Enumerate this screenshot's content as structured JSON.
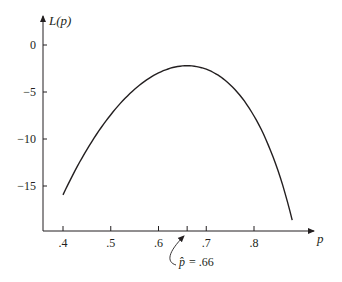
{
  "chart_data": {
    "type": "line",
    "title": "",
    "xlabel": "p",
    "ylabel": "L(p)",
    "xlim": [
      0.355,
      0.92
    ],
    "ylim": [
      -19.5,
      3.2
    ],
    "grid": false,
    "legend": null,
    "x_ticks": [
      0.4,
      0.5,
      0.6,
      0.7,
      0.8
    ],
    "x_tick_labels": [
      ".4",
      ".5",
      ".6",
      ".7",
      ".8"
    ],
    "y_ticks": [
      0,
      -5,
      -10,
      -15
    ],
    "y_tick_labels": [
      "0",
      "−5",
      "−10",
      "−15"
    ],
    "extra_x_tick": 0.66,
    "series": [
      {
        "name": "L(p)",
        "x": [
          0.4,
          0.45,
          0.5,
          0.55,
          0.6,
          0.66,
          0.7,
          0.75,
          0.8,
          0.85,
          0.88
        ],
        "y": [
          -15.95,
          -11.1,
          -7.4,
          -4.7,
          -2.96,
          -2.2,
          -2.57,
          -4.2,
          -7.55,
          -13.3,
          -18.6
        ]
      }
    ],
    "annotations": [
      {
        "text_symbol": "p̂",
        "text_rest": " = .66",
        "points_to_x": 0.66
      }
    ]
  },
  "labels": {
    "y_axis": "L(p)",
    "x_axis": "p",
    "annotation_hat": "p̂",
    "annotation_value": "= .66"
  }
}
